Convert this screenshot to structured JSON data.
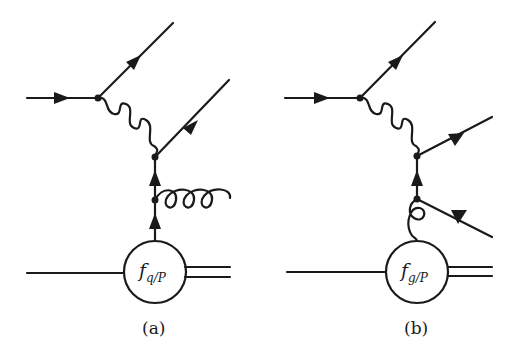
{
  "figure": {
    "type": "Feynman diagrams",
    "stroke_color": "#1a1a1a",
    "panels": [
      {
        "id": "a",
        "caption": "(a)",
        "blob_label_main": "f",
        "blob_label_sub": "q/P",
        "process": "virtual-photon exchange with quark from proton emitting a gluon",
        "lines": [
          "incoming lepton",
          "outgoing lepton",
          "virtual photon (wavy)",
          "outgoing quark",
          "quark from PDF",
          "emitted gluon (curly)",
          "proton (single line in)",
          "remnant (double line out)"
        ]
      },
      {
        "id": "b",
        "caption": "(b)",
        "blob_label_main": "f",
        "blob_label_sub": "g/P",
        "process": "virtual-photon exchange with gluon from proton splitting into quark-antiquark",
        "lines": [
          "incoming lepton",
          "outgoing lepton",
          "virtual photon (wavy)",
          "outgoing quark",
          "outgoing antiquark",
          "gluon from PDF (curly)",
          "proton (single line in)",
          "remnant (double line out)"
        ]
      }
    ]
  }
}
